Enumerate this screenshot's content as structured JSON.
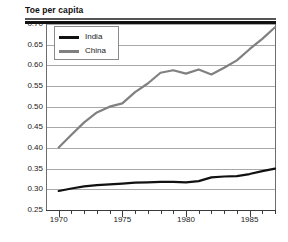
{
  "chart_data": {
    "type": "line",
    "title": "Toe per capita",
    "xlabel": "",
    "ylabel": "Toe per capita",
    "xlim": [
      1969,
      1987
    ],
    "ylim": [
      0.25,
      0.7
    ],
    "ytick_labels": [
      "0.70",
      "0.65",
      "0.60",
      "0.55",
      "0.50",
      "0.45",
      "0.40",
      "0.35",
      "0.30",
      "0.25"
    ],
    "ytick_values": [
      0.7,
      0.65,
      0.6,
      0.55,
      0.5,
      0.45,
      0.4,
      0.35,
      0.3,
      0.25
    ],
    "xtick_labels": [
      "1970",
      "1975",
      "1980",
      "1985"
    ],
    "xtick_values": [
      1970,
      1975,
      1980,
      1985
    ],
    "xminor_values": [
      1971,
      1972,
      1973,
      1974,
      1976,
      1977,
      1978,
      1979,
      1981,
      1982,
      1983,
      1984,
      1986,
      1987
    ],
    "grid": "horizontal",
    "legend_position": "top-left-inside",
    "series": [
      {
        "name": "India",
        "color": "#111111",
        "x": [
          1970,
          1971,
          1972,
          1973,
          1974,
          1975,
          1976,
          1977,
          1978,
          1979,
          1980,
          1981,
          1982,
          1983,
          1984,
          1985,
          1986,
          1987
        ],
        "values": [
          0.296,
          0.302,
          0.307,
          0.31,
          0.312,
          0.314,
          0.316,
          0.317,
          0.318,
          0.318,
          0.317,
          0.32,
          0.329,
          0.331,
          0.332,
          0.337,
          0.344,
          0.35
        ]
      },
      {
        "name": "China",
        "color": "#808080",
        "x": [
          1970,
          1971,
          1972,
          1973,
          1974,
          1975,
          1976,
          1977,
          1978,
          1979,
          1980,
          1981,
          1982,
          1983,
          1984,
          1985,
          1986,
          1987
        ],
        "values": [
          0.401,
          0.432,
          0.462,
          0.486,
          0.5,
          0.508,
          0.535,
          0.556,
          0.582,
          0.588,
          0.58,
          0.59,
          0.578,
          0.594,
          0.612,
          0.639,
          0.664,
          0.692
        ]
      }
    ]
  },
  "legend": {
    "entries": [
      {
        "label": "India",
        "color": "#111111"
      },
      {
        "label": "China",
        "color": "#808080"
      }
    ]
  }
}
